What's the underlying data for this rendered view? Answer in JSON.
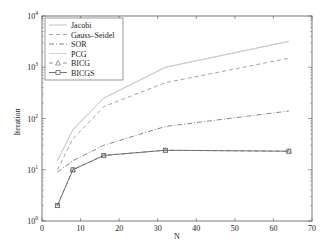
{
  "chart_data": {
    "type": "line",
    "title": "",
    "xlabel": "N",
    "ylabel": "Iteration",
    "xlim": [
      0,
      70
    ],
    "ylim": [
      1,
      10000
    ],
    "yscale": "log",
    "grid": false,
    "legend_position": "upper left",
    "x_ticks": [
      0,
      10,
      20,
      30,
      40,
      50,
      60,
      70
    ],
    "y_ticks": [
      {
        "value": 1,
        "base": "10",
        "exp": "0"
      },
      {
        "value": 10,
        "base": "10",
        "exp": "1"
      },
      {
        "value": 100,
        "base": "10",
        "exp": "2"
      },
      {
        "value": 1000,
        "base": "10",
        "exp": "3"
      },
      {
        "value": 10000,
        "base": "10",
        "exp": "4"
      }
    ],
    "x": [
      4,
      8,
      16,
      32,
      64
    ],
    "series": [
      {
        "name": "Jacobi",
        "values": [
          15,
          60,
          250,
          1000,
          3200
        ],
        "style": "solid",
        "color": "#bbbbbb",
        "marker": "none"
      },
      {
        "name": "Gauss–Seidel",
        "values": [
          10,
          40,
          170,
          500,
          1500
        ],
        "style": "dashed",
        "color": "#999999",
        "marker": "none"
      },
      {
        "name": "SOR",
        "values": [
          9,
          15,
          30,
          70,
          140
        ],
        "style": "dashdot",
        "color": "#777777",
        "marker": "none"
      },
      {
        "name": "PCG",
        "values": [
          15,
          60,
          250,
          1000,
          3200
        ],
        "style": "solid",
        "color": "#cccccc",
        "marker": "none"
      },
      {
        "name": "BICG",
        "values": [
          2,
          10,
          19,
          24,
          23
        ],
        "style": "dashed",
        "color": "#888888",
        "marker": "triangle"
      },
      {
        "name": "BICGS",
        "values": [
          2,
          10,
          19,
          24,
          23
        ],
        "style": "solid",
        "color": "#666666",
        "marker": "square"
      }
    ]
  }
}
